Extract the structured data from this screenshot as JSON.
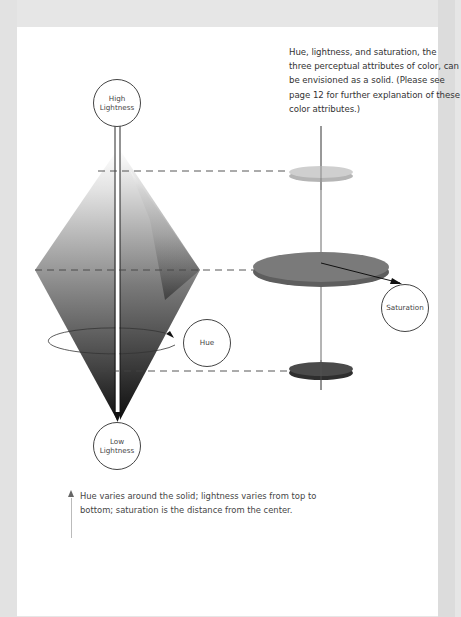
{
  "intro_text": "Hue, lightness, and saturation, the three perceptual attributes of color, can be envisioned as a solid. (Please see page 12 for further explanation of these color attributes.)",
  "labels": {
    "high_lightness_line1": "High",
    "high_lightness_line2": "Lightness",
    "low_lightness_line1": "Low",
    "low_lightness_line2": "Lightness",
    "hue": "Hue",
    "saturation": "Saturation"
  },
  "caption": "Hue varies around the solid; lightness varies from top to bottom; saturation is the distance from the center.",
  "colors": {
    "page_background": "#ffffff",
    "margin": "#e6e6e6",
    "disk_light": "#c9c9c9",
    "disk_mid": "#737373",
    "disk_dark": "#3d3d3d",
    "line": "#222222"
  },
  "slices": [
    {
      "name": "light",
      "level": "top"
    },
    {
      "name": "mid",
      "level": "middle"
    },
    {
      "name": "dark",
      "level": "bottom"
    }
  ]
}
